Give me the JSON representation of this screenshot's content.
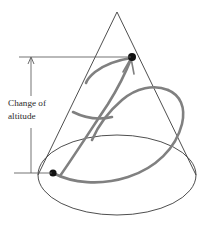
{
  "figure": {
    "annotation": {
      "line1": "Change of",
      "line2": "altitude"
    },
    "colors": {
      "cone_outline": "#3a3a3a",
      "geodesic": "#808080",
      "point": "#111111",
      "dimension": "#5a5a5a",
      "background": "#ffffff"
    },
    "geometry": {
      "apex": {
        "x": 117,
        "y": 12
      },
      "base_ellipse": {
        "cx": 117,
        "cy": 175,
        "rx": 79,
        "ry": 40
      },
      "start_point": {
        "x": 53,
        "y": 173
      },
      "end_point": {
        "x": 132,
        "y": 57
      },
      "altitude_top_y": 57,
      "altitude_bottom_y": 173,
      "dimension_x": 31
    }
  }
}
